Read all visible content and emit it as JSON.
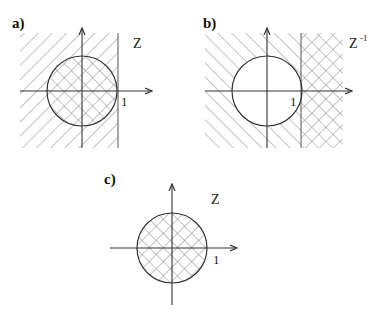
{
  "figure": {
    "panels": [
      {
        "id": "a",
        "label": "a)",
        "variable": "Z",
        "unit_label": "1",
        "description": "Left half-plane (Re < 1) hatched; unit circle cross-hatched"
      },
      {
        "id": "b",
        "label": "b)",
        "variable": "Z",
        "variable_exponent": "-1",
        "unit_label": "1",
        "description": "Region outside unit circle left of Re = 1 hatched; region Re > 1 cross-hatched; circle interior blank"
      },
      {
        "id": "c",
        "label": "c)",
        "variable": "Z",
        "unit_label": "1",
        "description": "Unit circle interior cross-hatched"
      }
    ]
  },
  "colors": {
    "line": "#333333",
    "hatch": "#8a8a8a"
  }
}
